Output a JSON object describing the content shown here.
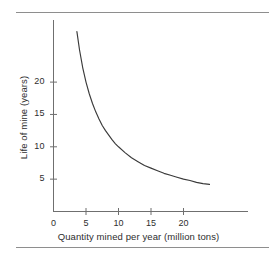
{
  "chart_data": {
    "type": "line",
    "title": "",
    "xlabel": "Quantity mined per year (million tons)",
    "ylabel": "Life of mine (years)",
    "xlim": [
      0,
      25.5
    ],
    "ylim": [
      0,
      29.5
    ],
    "grid": false,
    "legend": null,
    "xticks": [
      {
        "value": 0,
        "label": "0"
      },
      {
        "value": 5,
        "label": "5"
      },
      {
        "value": 10,
        "label": "10"
      },
      {
        "value": 15,
        "label": "15"
      },
      {
        "value": 20,
        "label": "20"
      }
    ],
    "yticks": [
      {
        "value": 5,
        "label": "5"
      },
      {
        "value": 10,
        "label": "10"
      },
      {
        "value": 15,
        "label": "15"
      },
      {
        "value": 20,
        "label": "20"
      }
    ],
    "relationship": "y = 100 / x",
    "series": [
      {
        "name": "Life of mine",
        "color": "#3a3a3a",
        "x": [
          3.6,
          4.0,
          4.5,
          5.0,
          5.5,
          6.0,
          6.5,
          7.0,
          7.5,
          8.0,
          8.5,
          9.0,
          9.5,
          10.0,
          11.0,
          12.0,
          13.0,
          14.0,
          15.0,
          16.0,
          17.0,
          18.0,
          19.0,
          20.0,
          21.0,
          22.0,
          23.0,
          24.0
        ],
        "y": [
          27.8,
          25.0,
          22.2,
          20.0,
          18.2,
          16.7,
          15.4,
          14.3,
          13.3,
          12.5,
          11.8,
          11.1,
          10.5,
          10.0,
          9.1,
          8.3,
          7.7,
          7.1,
          6.7,
          6.3,
          5.9,
          5.6,
          5.3,
          5.0,
          4.8,
          4.5,
          4.3,
          4.2
        ]
      }
    ]
  },
  "axis": {
    "x_axis_name": "x-axis",
    "y_axis_name": "y-axis"
  }
}
